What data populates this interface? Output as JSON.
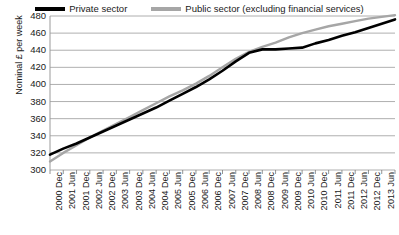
{
  "chart_data": {
    "type": "line",
    "title": "",
    "xlabel": "",
    "ylabel": "Nominal £ per week",
    "ylim": [
      300,
      480
    ],
    "ytick_step": 20,
    "yticks": [
      480,
      460,
      440,
      420,
      400,
      380,
      360,
      340,
      320,
      300
    ],
    "grid": true,
    "legend_position": "top",
    "categories": [
      "2000 Dec",
      "2001 Jun",
      "2001 Dec",
      "2002 Jun",
      "2002 Dec",
      "2003 Jun",
      "2003 Dec",
      "2004 Jun",
      "2004 Dec",
      "2005 Jun",
      "2005 Dec",
      "2006 Jun",
      "2006 Dec",
      "2007 Jun",
      "2007 Dec",
      "2008 Jun",
      "2008 Dec",
      "2009 Jun",
      "2009 Dec",
      "2010 Jun",
      "2010 Dec",
      "2011 Jun",
      "2011 Dec",
      "2012 Jun",
      "2012 Dec",
      "2013 Jun",
      "2013 Dec"
    ],
    "series": [
      {
        "name": "Private sector",
        "color": "#000000",
        "values": [
          318,
          325,
          331,
          338,
          345,
          352,
          359,
          366,
          373,
          381,
          389,
          397,
          406,
          416,
          427,
          437,
          441,
          441,
          442,
          443,
          448,
          452,
          457,
          461,
          466,
          471,
          476
        ]
      },
      {
        "name": "Public sector (excluding financial services)",
        "color": "#a6a6a6",
        "values": [
          310,
          320,
          329,
          338,
          346,
          354,
          362,
          370,
          378,
          386,
          393,
          401,
          410,
          420,
          430,
          438,
          444,
          449,
          455,
          460,
          464,
          468,
          471,
          474,
          477,
          479,
          481
        ]
      }
    ]
  },
  "legend": {
    "private": {
      "label": "Private sector",
      "color": "#000000"
    },
    "public": {
      "label": "Public sector (excluding financial services)",
      "color": "#a6a6a6"
    }
  },
  "axes": {
    "y_title": "Nominal £ per week"
  }
}
